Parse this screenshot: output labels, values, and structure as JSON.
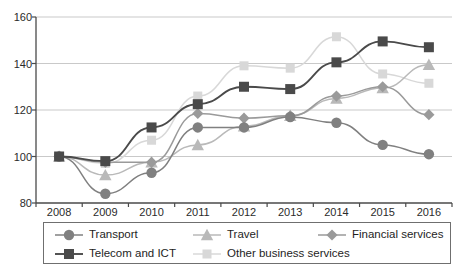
{
  "chart_data": {
    "type": "line",
    "title": "",
    "xlabel": "",
    "ylabel": "",
    "categories": [
      "2008",
      "2009",
      "2010",
      "2011",
      "2012",
      "2013",
      "2014",
      "2015",
      "2016"
    ],
    "ylim": [
      80,
      160
    ],
    "yticks": [
      80,
      100,
      120,
      140,
      160
    ],
    "grid": true,
    "legend_position": "bottom",
    "series": [
      {
        "name": "Transport",
        "marker": "circle",
        "color": "#808080",
        "values": [
          100,
          84,
          93,
          112.5,
          112.5,
          117,
          114.5,
          105,
          101
        ]
      },
      {
        "name": "Telecom and ICT",
        "marker": "square",
        "color": "#4a4a4a",
        "values": [
          100,
          98,
          112.5,
          122.5,
          130,
          129,
          140.5,
          149.5,
          147
        ]
      },
      {
        "name": "Travel",
        "marker": "triangle",
        "color": "#b9b9b9",
        "values": [
          100,
          92,
          97.5,
          105,
          113,
          117.5,
          125,
          129.5,
          139.5
        ]
      },
      {
        "name": "Financial services",
        "marker": "diamond",
        "color": "#9a9a9a",
        "values": [
          100,
          97.5,
          97.5,
          118.5,
          116.5,
          117.5,
          126,
          130,
          118
        ]
      },
      {
        "name": "Other business services",
        "marker": "square-light",
        "color": "#d8d8d8",
        "values": [
          100,
          97,
          107,
          126,
          139,
          138,
          151.5,
          135.5,
          131.5
        ]
      }
    ]
  },
  "axes": {
    "y_labels": [
      "160",
      "140",
      "120",
      "100",
      "80"
    ],
    "x_labels": [
      "2008",
      "2009",
      "2010",
      "2011",
      "2012",
      "2013",
      "2014",
      "2015",
      "2016"
    ]
  },
  "legend": {
    "entries": [
      {
        "label": "Transport"
      },
      {
        "label": "Travel"
      },
      {
        "label": "Financial services"
      },
      {
        "label": "Telecom and ICT"
      },
      {
        "label": "Other business services"
      }
    ]
  }
}
